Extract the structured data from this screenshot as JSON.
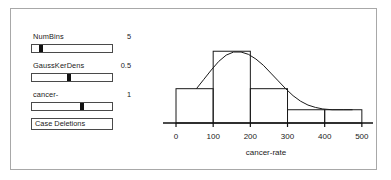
{
  "panel": {
    "controls": [
      {
        "name": "NumBins",
        "label": "NumBins",
        "value": "5",
        "thumb_pct": 9
      },
      {
        "name": "GaussKerDens",
        "label": "GaussKerDens",
        "value": "0.5",
        "thumb_pct": 46
      },
      {
        "name": "cancer-",
        "label": "cancer-",
        "value": "1",
        "thumb_pct": 63
      }
    ],
    "button": {
      "label": "Case Deletions"
    }
  },
  "chart_data": {
    "type": "bar",
    "title": "",
    "xlabel": "cancer-rate",
    "ylabel": "",
    "xlim": [
      -35,
      530
    ],
    "ylim": [
      0,
      1
    ],
    "grid": false,
    "legend": null,
    "xticks": [
      0,
      100,
      200,
      300,
      400,
      500
    ],
    "xtick_labels": [
      "0",
      "100",
      "200",
      "300",
      "400",
      "500"
    ],
    "bin_edges": [
      0,
      100,
      200,
      300,
      400,
      500
    ],
    "bin_labels": [
      "0-100",
      "100-200",
      "200-300",
      "300-400",
      "400-500"
    ],
    "values": [
      0.44,
      0.92,
      0.44,
      0.17,
      0.17
    ],
    "overlay": {
      "name": "Gaussian kernel density",
      "type": "line",
      "x": [
        55,
        75,
        95,
        115,
        135,
        155,
        175,
        195,
        215,
        235,
        255,
        275,
        295,
        315,
        335,
        355,
        375,
        395,
        420,
        450,
        475
      ],
      "y": [
        0.44,
        0.56,
        0.68,
        0.79,
        0.87,
        0.91,
        0.91,
        0.88,
        0.82,
        0.74,
        0.64,
        0.54,
        0.44,
        0.35,
        0.28,
        0.23,
        0.2,
        0.18,
        0.17,
        0.17,
        0.17
      ]
    }
  }
}
